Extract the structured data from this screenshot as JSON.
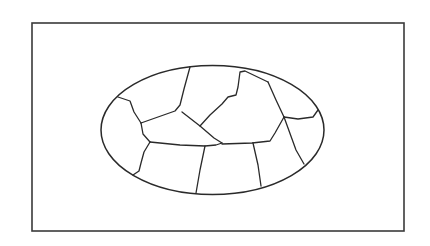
{
  "diagram": {
    "type": "region-map",
    "colors": {
      "background": "#ffffff",
      "line": "#2a2a2a",
      "frame": "#3a3a3a"
    },
    "frame": {
      "x": 32,
      "y": 23,
      "width": 372,
      "height": 208
    },
    "ellipse": {
      "cx": 212.5,
      "cy": 130,
      "rx": 111.5,
      "ry": 64.5
    },
    "region_count": 11,
    "boundaries": [
      "M118,97 L130,101 L134,112 L141,123",
      "M141,123 L143,134 L150,142",
      "M141,123 L175,111 L180,105 L184,89 L190,67",
      "M182,112 L200,126 L214,138 L222,143",
      "M200,126 L210,115 L222,104 L228,97 L236,95 L238,87 L240,72 L245,71 L268,82",
      "M268,82 L276,100 L284,117",
      "M284,117 L298,119 L313,117 L318,110",
      "M284,117 L275,133 L270,141 L252,143 L222,144",
      "M150,142 L180,145 L205,146 L216,145 L222,143",
      "M150,142 L144,152 L141,163 L139,171 L133,175",
      "M205,146 L200,170 L196,193",
      "M253,143 L258,165 L261,186",
      "M284,117 L296,150 L304,164"
    ]
  }
}
